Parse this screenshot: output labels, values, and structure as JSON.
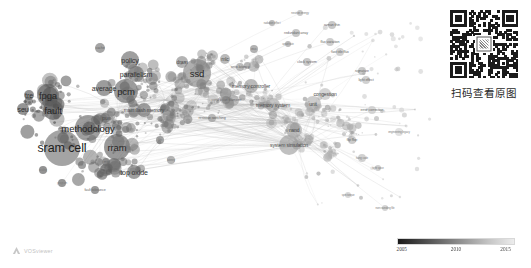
{
  "app": {
    "tool_name": "VOSviewer",
    "background": "#ffffff"
  },
  "qr_panel": {
    "caption": "扫码查看原图",
    "qr_name": "qr-code"
  },
  "legend": {
    "type": "continuous-color-scale",
    "unit": "year",
    "ticks": [
      {
        "label": "2005",
        "pos": 4
      },
      {
        "label": "2010",
        "pos": 50
      },
      {
        "label": "2015",
        "pos": 92
      }
    ],
    "gradient_from": "#1a1a1a",
    "gradient_to": "#ececec"
  },
  "map": {
    "title": "",
    "nodes": [
      {
        "label": "sram cell",
        "x": 62,
        "y": 148,
        "r": 18,
        "size": "xl"
      },
      {
        "label": "methodology",
        "x": 88,
        "y": 128,
        "r": 13,
        "size": "lg"
      },
      {
        "label": "rram",
        "x": 117,
        "y": 147,
        "r": 13,
        "size": "lg"
      },
      {
        "label": "fpga",
        "x": 48,
        "y": 95,
        "r": 11,
        "size": "lg"
      },
      {
        "label": "fault",
        "x": 53,
        "y": 110,
        "r": 10,
        "size": "lg"
      },
      {
        "label": "seu",
        "x": 23,
        "y": 109,
        "r": 6,
        "size": "md"
      },
      {
        "label": "tre",
        "x": 29,
        "y": 95,
        "r": 5,
        "size": "md"
      },
      {
        "label": "pcm",
        "x": 126,
        "y": 91,
        "r": 12,
        "size": "lg"
      },
      {
        "label": "average",
        "x": 104,
        "y": 88,
        "r": 8,
        "size": "md"
      },
      {
        "label": "policy",
        "x": 130,
        "y": 60,
        "r": 9,
        "size": "md"
      },
      {
        "label": "parallelism",
        "x": 136,
        "y": 74,
        "r": 8,
        "size": "md"
      },
      {
        "label": "ssd",
        "x": 197,
        "y": 73,
        "r": 14,
        "size": "lg"
      },
      {
        "label": "top oxide",
        "x": 134,
        "y": 172,
        "r": 7,
        "size": "md"
      },
      {
        "label": "main flash memory",
        "x": 144,
        "y": 110,
        "r": 7,
        "size": "sm"
      },
      {
        "label": "memory controller",
        "x": 251,
        "y": 86,
        "r": 7,
        "size": "sm"
      },
      {
        "label": "memory system",
        "x": 273,
        "y": 105,
        "r": 7,
        "size": "sm"
      },
      {
        "label": "unit",
        "x": 313,
        "y": 104,
        "r": 8,
        "size": "sm"
      },
      {
        "label": "congestion",
        "x": 325,
        "y": 94,
        "r": 6,
        "size": "sm"
      },
      {
        "label": "nand",
        "x": 294,
        "y": 130,
        "r": 8,
        "size": "sm"
      },
      {
        "label": "system simulation",
        "x": 289,
        "y": 145,
        "r": 10,
        "size": "sm"
      },
      {
        "label": "pu",
        "x": 105,
        "y": 118,
        "r": 5,
        "size": "sm"
      },
      {
        "label": "dram",
        "x": 182,
        "y": 62,
        "r": 6,
        "size": "sm"
      },
      {
        "label": "mlc",
        "x": 225,
        "y": 59,
        "r": 5,
        "size": "sm"
      },
      {
        "label": "cache",
        "x": 100,
        "y": 48,
        "r": 5,
        "size": "xs"
      },
      {
        "label": "signature",
        "x": 362,
        "y": 71,
        "r": 4,
        "size": "xs"
      },
      {
        "label": "light effect",
        "x": 366,
        "y": 80,
        "r": 4,
        "size": "xs"
      },
      {
        "label": "clock system",
        "x": 307,
        "y": 62,
        "r": 4,
        "size": "xs"
      },
      {
        "label": "redundant array",
        "x": 296,
        "y": 33,
        "r": 4,
        "size": "xs"
      },
      {
        "label": "raman thin",
        "x": 332,
        "y": 25,
        "r": 4,
        "size": "xs"
      },
      {
        "label": "flux variation",
        "x": 330,
        "y": 42,
        "r": 4,
        "size": "xs"
      },
      {
        "label": "fast title flux",
        "x": 340,
        "y": 52,
        "r": 4,
        "size": "xs"
      },
      {
        "label": "neutron energy",
        "x": 300,
        "y": 13,
        "r": 3,
        "size": "tn"
      },
      {
        "label": "upset rate",
        "x": 288,
        "y": 44,
        "r": 3,
        "size": "tn"
      },
      {
        "label": "radiation effect",
        "x": 272,
        "y": 23,
        "r": 3,
        "size": "tn"
      },
      {
        "label": "conductive filament",
        "x": 226,
        "y": 100,
        "r": 4,
        "size": "xs"
      },
      {
        "label": "resistive switching",
        "x": 212,
        "y": 118,
        "r": 4,
        "size": "xs"
      },
      {
        "label": "write latency",
        "x": 240,
        "y": 67,
        "r": 4,
        "size": "xs"
      },
      {
        "label": "ecc",
        "x": 254,
        "y": 49,
        "r": 4,
        "size": "xs"
      },
      {
        "label": "error correction",
        "x": 372,
        "y": 110,
        "r": 4,
        "size": "xs"
      },
      {
        "label": "engineering legacy",
        "x": 399,
        "y": 132,
        "r": 4,
        "size": "tn"
      },
      {
        "label": "flip flop",
        "x": 352,
        "y": 140,
        "r": 4,
        "size": "xs"
      },
      {
        "label": "hang code",
        "x": 362,
        "y": 158,
        "r": 4,
        "size": "tn"
      },
      {
        "label": "tight spice",
        "x": 378,
        "y": 168,
        "r": 3,
        "size": "tn"
      },
      {
        "label": "non rounding file",
        "x": 385,
        "y": 208,
        "r": 3,
        "size": "tn"
      },
      {
        "label": "spin torque",
        "x": 348,
        "y": 195,
        "r": 3,
        "size": "tn"
      },
      {
        "label": "fault tolerance",
        "x": 95,
        "y": 190,
        "r": 4,
        "size": "xs"
      },
      {
        "label": "program",
        "x": 62,
        "y": 183,
        "r": 4,
        "size": "tn"
      },
      {
        "label": "mtj",
        "x": 106,
        "y": 162,
        "r": 4,
        "size": "xs"
      },
      {
        "label": "scaling",
        "x": 43,
        "y": 170,
        "r": 4,
        "size": "tn"
      },
      {
        "label": "vt",
        "x": 82,
        "y": 165,
        "r": 4,
        "size": "tn"
      },
      {
        "label": "film",
        "x": 160,
        "y": 140,
        "r": 4,
        "size": "tn"
      },
      {
        "label": "latency",
        "x": 171,
        "y": 160,
        "r": 4,
        "size": "tn"
      }
    ]
  }
}
